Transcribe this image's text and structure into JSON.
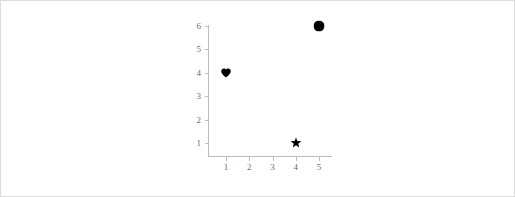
{
  "figure": {
    "background_color": "#ffffff",
    "frame_color": "#dcdcdc",
    "axis_color": "#bdbdbd",
    "tick_label_color": "#6e6e6e",
    "marker_color": "#000000"
  },
  "chart_data": {
    "type": "scatter",
    "title": "",
    "xlabel": "",
    "ylabel": "",
    "xlim": [
      0.55,
      5.45
    ],
    "ylim": [
      0.4,
      6.4
    ],
    "xticks": [
      1,
      2,
      3,
      4,
      5
    ],
    "yticks": [
      1,
      2,
      3,
      4,
      5,
      6
    ],
    "xticklabels": [
      "1",
      "2",
      "3",
      "4",
      "5"
    ],
    "yticklabels": [
      "1",
      "2",
      "3",
      "4",
      "5",
      "6"
    ],
    "grid": false,
    "legend": false,
    "points": [
      {
        "x": 1,
        "y": 4,
        "marker": "heart",
        "color": "#000000",
        "size": 11
      },
      {
        "x": 4,
        "y": 1,
        "marker": "star",
        "color": "#000000",
        "size": 12
      },
      {
        "x": 5,
        "y": 6,
        "marker": "circle",
        "color": "#000000",
        "size": 11
      }
    ]
  }
}
